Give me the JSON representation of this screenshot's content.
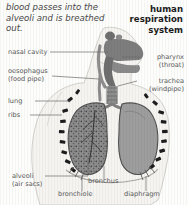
{
  "figure": {
    "title_lines": [
      "human",
      "respiration",
      "system"
    ],
    "intro_text": "blood passes into the alveoli and is breathed out.",
    "background_color": "#fdfdfb",
    "label_color": "#5b5b5b",
    "organ_fill_color": "#9b9b9b",
    "airway_color": "#6e6e6e",
    "rib_color": "#1f1f1f",
    "leader_line_color": "#6b6b6b"
  },
  "labels": {
    "left": [
      {
        "name": "nasal-cavity",
        "text": "nasal cavity",
        "sub": ""
      },
      {
        "name": "oesophagus",
        "text": "oesophagus",
        "sub": "(food pipe)"
      },
      {
        "name": "lung",
        "text": "lung",
        "sub": ""
      },
      {
        "name": "ribs",
        "text": "ribs",
        "sub": ""
      },
      {
        "name": "alveoli",
        "text": "alveoli",
        "sub": "(air sacs)"
      }
    ],
    "right": [
      {
        "name": "pharynx",
        "text": "pharynx",
        "sub": "(throat)"
      },
      {
        "name": "trachea",
        "text": "trachea",
        "sub": "(windpipe)"
      }
    ],
    "bottom": [
      {
        "name": "bronchus",
        "text": "bronchus"
      },
      {
        "name": "bronchiole",
        "text": "bronchiole"
      },
      {
        "name": "diaphragm",
        "text": "diaphragm"
      }
    ]
  }
}
